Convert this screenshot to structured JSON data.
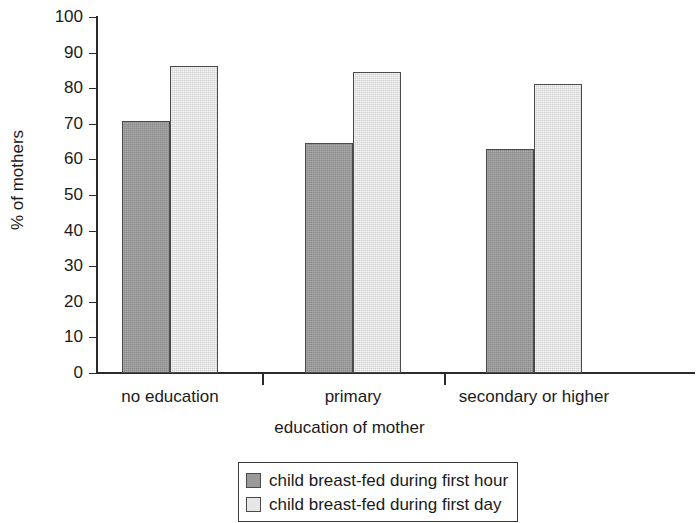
{
  "chart_data": {
    "type": "bar",
    "title": "",
    "subtitle": "",
    "xlabel": "education of mother",
    "ylabel": "% of mothers",
    "categories": [
      "no education",
      "primary",
      "secondary or higher"
    ],
    "series": [
      {
        "name": "child breast-fed during first hour",
        "color": "#9a9a9a",
        "values": [
          70.7,
          64.7,
          62.8
        ]
      },
      {
        "name": "child breast-fed during first day",
        "color": "#e6e6e6",
        "values": [
          86.3,
          84.6,
          81.3
        ]
      }
    ],
    "ylim": [
      0,
      100
    ],
    "ytick_step": 10,
    "yticks": [
      "100",
      "90",
      "80",
      "70",
      "60",
      "50",
      "40",
      "30",
      "20",
      "10",
      "0"
    ],
    "grid": false,
    "legend_position": "bottom-center",
    "axis_color": "#2b2b2b",
    "bar_border_color": "#4a4a4a"
  },
  "legend": {
    "entries": [
      "child breast-fed during first hour",
      "child breast-fed during first day"
    ]
  }
}
